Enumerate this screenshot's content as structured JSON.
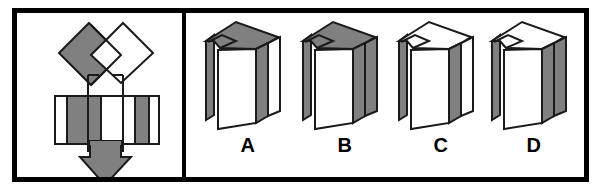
{
  "item": {
    "type": "spatial-folding-test-item",
    "instruction_arrow": "down-arrow",
    "label_a": "A",
    "label_b": "B",
    "label_c": "C",
    "label_d": "D"
  },
  "colors": {
    "gray_fill": "#808080",
    "white_fill": "#ffffff",
    "outline": "#1a1a1a",
    "frame": "#000000",
    "background": "#ffffff"
  },
  "stimulus": {
    "name": "unfolded-net",
    "description": "Flat pattern with two rotated squares on top (left gray, right white) overlapping, a horizontal rectangle band below with gray interior and white end strips, and a downward arrow indicating folding",
    "parts": [
      {
        "name": "top-left-diamond",
        "fill": "gray"
      },
      {
        "name": "top-right-diamond",
        "fill": "white"
      },
      {
        "name": "middle-band-left-strip",
        "fill": "white"
      },
      {
        "name": "middle-band-left-panel",
        "fill": "gray"
      },
      {
        "name": "middle-band-center-panel",
        "fill": "white"
      },
      {
        "name": "middle-band-right-panel",
        "fill": "gray"
      },
      {
        "name": "middle-band-right-strip",
        "fill": "white"
      },
      {
        "name": "fold-arrow",
        "fill": "gray"
      }
    ]
  },
  "options": [
    {
      "label": "A",
      "name": "option-a",
      "top_flap": "gray",
      "front_face": "white",
      "right_side": "gray",
      "far_right_panel": "white",
      "left_back_panel": "gray"
    },
    {
      "label": "B",
      "name": "option-b",
      "top_flap": "gray",
      "front_face": "white",
      "right_side": "gray",
      "far_right_panel": "gray",
      "left_back_panel": "gray"
    },
    {
      "label": "C",
      "name": "option-c",
      "top_flap": "white",
      "front_face": "white",
      "right_side": "gray",
      "far_right_panel": "white",
      "left_back_panel": "gray"
    },
    {
      "label": "D",
      "name": "option-d",
      "top_flap": "white",
      "front_face": "white",
      "right_side": "gray",
      "far_right_panel": "gray",
      "left_back_panel": "gray"
    }
  ]
}
